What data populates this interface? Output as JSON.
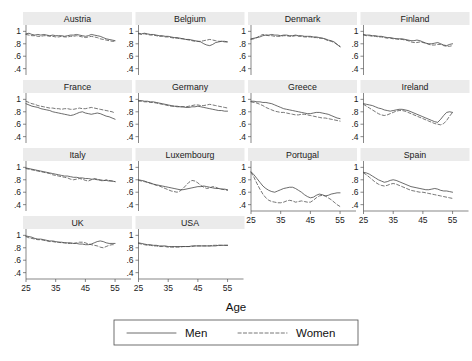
{
  "chart_data": {
    "type": "line",
    "title": "",
    "xlabel": "Age",
    "ylabel": "",
    "xlim": [
      25,
      57
    ],
    "ylim": [
      0.33,
      1.07
    ],
    "xticks": [
      25,
      35,
      45,
      55
    ],
    "xticklabels": [
      "25",
      "35",
      "45",
      "55"
    ],
    "yticks": [
      1,
      0.8,
      0.6,
      0.4
    ],
    "yticklabels": [
      "1",
      ".8",
      ".6",
      ".4"
    ],
    "grid": false,
    "legend_position": "bottom-center",
    "legend": [
      {
        "name": "Men",
        "style": "solid"
      },
      {
        "name": "Women",
        "style": "dashed"
      }
    ],
    "layout": {
      "rows": 4,
      "cols": 4,
      "panels_used": 14
    },
    "series_names": [
      "Men",
      "Women"
    ],
    "x": [
      25,
      26,
      27,
      28,
      29,
      30,
      31,
      32,
      33,
      34,
      35,
      36,
      37,
      38,
      39,
      40,
      41,
      42,
      43,
      44,
      45,
      46,
      47,
      48,
      49,
      50,
      51,
      52,
      53,
      54,
      55
    ],
    "panels": [
      {
        "title": "Austria",
        "row": 0,
        "col": 0,
        "men": [
          0.96,
          0.97,
          0.95,
          0.94,
          0.95,
          0.94,
          0.95,
          0.94,
          0.93,
          0.94,
          0.93,
          0.93,
          0.93,
          0.92,
          0.93,
          0.94,
          0.94,
          0.95,
          0.94,
          0.93,
          0.92,
          0.93,
          0.95,
          0.94,
          0.93,
          0.92,
          0.9,
          0.88,
          0.87,
          0.86,
          0.85
        ],
        "women": [
          0.95,
          0.94,
          0.93,
          0.93,
          0.92,
          0.92,
          0.93,
          0.93,
          0.92,
          0.92,
          0.91,
          0.91,
          0.92,
          0.91,
          0.91,
          0.92,
          0.92,
          0.93,
          0.92,
          0.91,
          0.9,
          0.91,
          0.92,
          0.91,
          0.9,
          0.88,
          0.87,
          0.86,
          0.85,
          0.84,
          0.84
        ]
      },
      {
        "title": "Belgium",
        "row": 0,
        "col": 1,
        "men": [
          0.97,
          0.96,
          0.97,
          0.96,
          0.95,
          0.95,
          0.94,
          0.93,
          0.93,
          0.92,
          0.92,
          0.91,
          0.9,
          0.9,
          0.89,
          0.88,
          0.87,
          0.87,
          0.86,
          0.85,
          0.84,
          0.83,
          0.8,
          0.78,
          0.77,
          0.79,
          0.82,
          0.83,
          0.84,
          0.84,
          0.83
        ],
        "women": [
          0.96,
          0.95,
          0.96,
          0.95,
          0.94,
          0.94,
          0.93,
          0.92,
          0.92,
          0.91,
          0.91,
          0.9,
          0.89,
          0.89,
          0.88,
          0.88,
          0.87,
          0.86,
          0.85,
          0.84,
          0.84,
          0.84,
          0.85,
          0.86,
          0.87,
          0.86,
          0.85,
          0.84,
          0.84,
          0.83,
          0.83
        ]
      },
      {
        "title": "Denmark",
        "row": 0,
        "col": 2,
        "men": [
          0.88,
          0.89,
          0.9,
          0.91,
          0.93,
          0.94,
          0.94,
          0.95,
          0.94,
          0.94,
          0.93,
          0.94,
          0.94,
          0.93,
          0.93,
          0.94,
          0.93,
          0.93,
          0.92,
          0.92,
          0.92,
          0.91,
          0.91,
          0.9,
          0.89,
          0.88,
          0.86,
          0.85,
          0.83,
          0.79,
          0.75
        ],
        "women": [
          0.87,
          0.88,
          0.9,
          0.93,
          0.95,
          0.94,
          0.93,
          0.93,
          0.92,
          0.92,
          0.92,
          0.93,
          0.93,
          0.92,
          0.92,
          0.93,
          0.92,
          0.92,
          0.91,
          0.91,
          0.91,
          0.9,
          0.9,
          0.89,
          0.89,
          0.87,
          0.85,
          0.84,
          0.82,
          0.79,
          0.76
        ]
      },
      {
        "title": "Finland",
        "row": 0,
        "col": 3,
        "men": [
          0.95,
          0.94,
          0.94,
          0.93,
          0.93,
          0.92,
          0.92,
          0.91,
          0.9,
          0.9,
          0.89,
          0.88,
          0.88,
          0.88,
          0.87,
          0.86,
          0.85,
          0.85,
          0.86,
          0.85,
          0.83,
          0.81,
          0.8,
          0.8,
          0.81,
          0.82,
          0.8,
          0.78,
          0.77,
          0.79,
          0.8
        ],
        "women": [
          0.94,
          0.93,
          0.93,
          0.92,
          0.92,
          0.91,
          0.91,
          0.9,
          0.89,
          0.89,
          0.88,
          0.88,
          0.87,
          0.87,
          0.86,
          0.85,
          0.83,
          0.82,
          0.82,
          0.83,
          0.82,
          0.81,
          0.79,
          0.78,
          0.78,
          0.79,
          0.79,
          0.77,
          0.76,
          0.76,
          0.77
        ]
      },
      {
        "title": "France",
        "row": 1,
        "col": 0,
        "men": [
          0.93,
          0.91,
          0.89,
          0.88,
          0.87,
          0.85,
          0.84,
          0.83,
          0.82,
          0.8,
          0.79,
          0.78,
          0.77,
          0.76,
          0.75,
          0.74,
          0.75,
          0.77,
          0.79,
          0.8,
          0.78,
          0.77,
          0.76,
          0.77,
          0.78,
          0.77,
          0.75,
          0.73,
          0.72,
          0.7,
          0.68
        ],
        "women": [
          0.97,
          0.95,
          0.93,
          0.92,
          0.9,
          0.89,
          0.88,
          0.87,
          0.86,
          0.86,
          0.85,
          0.85,
          0.84,
          0.85,
          0.85,
          0.84,
          0.84,
          0.85,
          0.86,
          0.85,
          0.85,
          0.86,
          0.87,
          0.86,
          0.85,
          0.84,
          0.83,
          0.82,
          0.81,
          0.8,
          0.78
        ]
      },
      {
        "title": "Germany",
        "row": 1,
        "col": 1,
        "men": [
          0.98,
          0.98,
          0.97,
          0.97,
          0.96,
          0.96,
          0.95,
          0.94,
          0.93,
          0.92,
          0.91,
          0.9,
          0.89,
          0.89,
          0.88,
          0.88,
          0.87,
          0.87,
          0.88,
          0.88,
          0.89,
          0.88,
          0.87,
          0.86,
          0.85,
          0.84,
          0.83,
          0.82,
          0.82,
          0.81,
          0.81
        ],
        "women": [
          0.97,
          0.97,
          0.96,
          0.96,
          0.95,
          0.95,
          0.94,
          0.93,
          0.92,
          0.91,
          0.9,
          0.89,
          0.89,
          0.88,
          0.88,
          0.88,
          0.88,
          0.89,
          0.9,
          0.91,
          0.91,
          0.9,
          0.9,
          0.91,
          0.92,
          0.91,
          0.9,
          0.89,
          0.88,
          0.87,
          0.86
        ]
      },
      {
        "title": "Greece",
        "row": 1,
        "col": 2,
        "men": [
          0.97,
          0.97,
          0.96,
          0.96,
          0.95,
          0.95,
          0.94,
          0.93,
          0.91,
          0.89,
          0.87,
          0.85,
          0.84,
          0.83,
          0.82,
          0.81,
          0.8,
          0.79,
          0.78,
          0.77,
          0.77,
          0.78,
          0.79,
          0.79,
          0.78,
          0.77,
          0.76,
          0.74,
          0.72,
          0.7,
          0.69
        ],
        "women": [
          0.96,
          0.95,
          0.94,
          0.92,
          0.9,
          0.87,
          0.85,
          0.83,
          0.81,
          0.8,
          0.79,
          0.79,
          0.78,
          0.77,
          0.76,
          0.75,
          0.75,
          0.76,
          0.76,
          0.75,
          0.74,
          0.73,
          0.72,
          0.71,
          0.7,
          0.7,
          0.69,
          0.68,
          0.67,
          0.66,
          0.65
        ]
      },
      {
        "title": "Ireland",
        "row": 1,
        "col": 3,
        "men": [
          0.93,
          0.92,
          0.91,
          0.9,
          0.88,
          0.86,
          0.85,
          0.83,
          0.82,
          0.81,
          0.82,
          0.83,
          0.84,
          0.84,
          0.83,
          0.82,
          0.8,
          0.78,
          0.76,
          0.74,
          0.72,
          0.7,
          0.68,
          0.66,
          0.64,
          0.63,
          0.68,
          0.74,
          0.79,
          0.8,
          0.79
        ],
        "women": [
          0.92,
          0.89,
          0.86,
          0.83,
          0.8,
          0.77,
          0.75,
          0.74,
          0.75,
          0.77,
          0.79,
          0.81,
          0.82,
          0.82,
          0.81,
          0.79,
          0.77,
          0.75,
          0.73,
          0.71,
          0.69,
          0.67,
          0.65,
          0.63,
          0.61,
          0.6,
          0.59,
          0.61,
          0.66,
          0.73,
          0.79
        ]
      },
      {
        "title": "Italy",
        "row": 2,
        "col": 0,
        "men": [
          0.99,
          0.98,
          0.97,
          0.96,
          0.95,
          0.94,
          0.93,
          0.92,
          0.91,
          0.9,
          0.89,
          0.88,
          0.87,
          0.86,
          0.86,
          0.85,
          0.84,
          0.84,
          0.83,
          0.83,
          0.82,
          0.82,
          0.81,
          0.81,
          0.8,
          0.8,
          0.79,
          0.79,
          0.78,
          0.78,
          0.77
        ],
        "women": [
          0.98,
          0.97,
          0.96,
          0.95,
          0.94,
          0.93,
          0.92,
          0.91,
          0.9,
          0.88,
          0.87,
          0.86,
          0.85,
          0.84,
          0.83,
          0.81,
          0.8,
          0.81,
          0.82,
          0.81,
          0.79,
          0.78,
          0.8,
          0.82,
          0.81,
          0.79,
          0.78,
          0.8,
          0.79,
          0.78,
          0.77
        ]
      },
      {
        "title": "Luxembourg",
        "row": 2,
        "col": 1,
        "men": [
          0.8,
          0.79,
          0.78,
          0.76,
          0.75,
          0.73,
          0.72,
          0.71,
          0.7,
          0.69,
          0.68,
          0.67,
          0.66,
          0.65,
          0.64,
          0.64,
          0.65,
          0.66,
          0.67,
          0.68,
          0.69,
          0.69,
          0.7,
          0.69,
          0.68,
          0.67,
          0.66,
          0.66,
          0.65,
          0.65,
          0.64
        ],
        "women": [
          0.79,
          0.78,
          0.77,
          0.76,
          0.74,
          0.73,
          0.71,
          0.7,
          0.68,
          0.66,
          0.64,
          0.62,
          0.61,
          0.6,
          0.62,
          0.66,
          0.71,
          0.76,
          0.79,
          0.78,
          0.75,
          0.71,
          0.68,
          0.66,
          0.67,
          0.69,
          0.68,
          0.66,
          0.65,
          0.64,
          0.63
        ]
      },
      {
        "title": "Portugal",
        "row": 2,
        "col": 2,
        "men": [
          0.93,
          0.88,
          0.82,
          0.76,
          0.7,
          0.66,
          0.63,
          0.61,
          0.6,
          0.62,
          0.64,
          0.66,
          0.67,
          0.68,
          0.68,
          0.66,
          0.63,
          0.6,
          0.56,
          0.53,
          0.51,
          0.52,
          0.55,
          0.57,
          0.56,
          0.54,
          0.55,
          0.57,
          0.58,
          0.59,
          0.59
        ],
        "women": [
          0.92,
          0.84,
          0.74,
          0.65,
          0.57,
          0.51,
          0.47,
          0.45,
          0.44,
          0.43,
          0.43,
          0.44,
          0.46,
          0.47,
          0.46,
          0.44,
          0.45,
          0.46,
          0.45,
          0.44,
          0.44,
          0.47,
          0.51,
          0.54,
          0.55,
          0.54,
          0.51,
          0.48,
          0.44,
          0.4,
          0.37
        ]
      },
      {
        "title": "Spain",
        "row": 2,
        "col": 3,
        "men": [
          0.92,
          0.91,
          0.89,
          0.86,
          0.83,
          0.8,
          0.78,
          0.76,
          0.77,
          0.79,
          0.8,
          0.79,
          0.77,
          0.75,
          0.73,
          0.71,
          0.69,
          0.68,
          0.67,
          0.66,
          0.65,
          0.64,
          0.64,
          0.65,
          0.66,
          0.65,
          0.63,
          0.62,
          0.62,
          0.61,
          0.6
        ],
        "women": [
          0.91,
          0.88,
          0.84,
          0.8,
          0.76,
          0.73,
          0.71,
          0.7,
          0.71,
          0.73,
          0.74,
          0.73,
          0.71,
          0.69,
          0.67,
          0.65,
          0.63,
          0.62,
          0.61,
          0.6,
          0.6,
          0.59,
          0.58,
          0.57,
          0.56,
          0.55,
          0.54,
          0.53,
          0.52,
          0.51,
          0.5
        ]
      },
      {
        "title": "UK",
        "row": 3,
        "col": 0,
        "men": [
          0.99,
          0.98,
          0.97,
          0.95,
          0.94,
          0.94,
          0.93,
          0.92,
          0.91,
          0.91,
          0.9,
          0.89,
          0.89,
          0.88,
          0.88,
          0.88,
          0.87,
          0.87,
          0.86,
          0.86,
          0.85,
          0.85,
          0.86,
          0.88,
          0.9,
          0.91,
          0.9,
          0.88,
          0.87,
          0.87,
          0.87
        ],
        "women": [
          0.98,
          0.96,
          0.95,
          0.94,
          0.93,
          0.93,
          0.92,
          0.91,
          0.9,
          0.9,
          0.89,
          0.89,
          0.88,
          0.88,
          0.87,
          0.87,
          0.87,
          0.88,
          0.89,
          0.89,
          0.88,
          0.86,
          0.85,
          0.84,
          0.83,
          0.81,
          0.8,
          0.82,
          0.84,
          0.85,
          0.85
        ]
      },
      {
        "title": "USA",
        "row": 3,
        "col": 1,
        "men": [
          0.88,
          0.87,
          0.86,
          0.85,
          0.85,
          0.84,
          0.84,
          0.83,
          0.83,
          0.83,
          0.82,
          0.82,
          0.82,
          0.82,
          0.82,
          0.82,
          0.82,
          0.82,
          0.83,
          0.83,
          0.83,
          0.83,
          0.83,
          0.83,
          0.83,
          0.83,
          0.83,
          0.84,
          0.84,
          0.84,
          0.84
        ],
        "women": [
          0.87,
          0.86,
          0.85,
          0.84,
          0.84,
          0.83,
          0.83,
          0.82,
          0.82,
          0.82,
          0.81,
          0.81,
          0.81,
          0.81,
          0.81,
          0.82,
          0.82,
          0.82,
          0.82,
          0.83,
          0.83,
          0.83,
          0.83,
          0.83,
          0.83,
          0.84,
          0.84,
          0.84,
          0.84,
          0.84,
          0.84
        ]
      }
    ]
  }
}
